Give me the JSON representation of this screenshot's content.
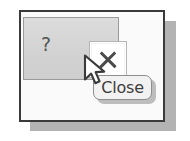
{
  "illustration": {
    "title": "Close button with tooltip",
    "background_color": "#ffffff"
  },
  "window": {
    "name": "application-window",
    "border_color": "#3a3a3a",
    "body_color": "#fafafa",
    "shadow_color": "#b3b3b3"
  },
  "title_bar": {
    "background_color": "#d6d6d6",
    "border_color": "#9a9a9a"
  },
  "buttons": {
    "help": {
      "label": "?",
      "icon": "question-mark-icon",
      "state": "normal",
      "glyph_color": "#555555"
    },
    "close": {
      "label": "✕",
      "icon": "close-x-icon",
      "state": "hovered",
      "background_color": "#ffffff",
      "border_color": "#b4b4b4",
      "glyph_color": "#4a4a4a"
    }
  },
  "cursor": {
    "icon": "mouse-pointer-icon",
    "fill_color": "#ffffff",
    "outline_color": "#3a3a3a"
  },
  "tooltip": {
    "text": "Close",
    "background_color": "#f2f2f2",
    "border_color": "#8e8e8e",
    "text_color": "#3d3d3d",
    "shadow_color": "#bdbdbd"
  }
}
